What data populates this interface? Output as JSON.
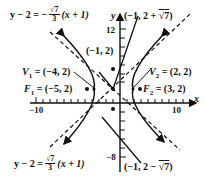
{
  "figure": {
    "type": "hyperbola-graph",
    "center": {
      "label": "(−1, 2)",
      "x": -1,
      "y": 2
    },
    "vertices": [
      {
        "name": "V",
        "sub": "1",
        "label": "= (−4, 2)",
        "x": -4,
        "y": 2
      },
      {
        "name": "V",
        "sub": "2",
        "label": "= (2, 2)",
        "x": 2,
        "y": 2
      }
    ],
    "foci": [
      {
        "name": "F",
        "sub": "1",
        "label": "= (−5, 2)",
        "x": -5,
        "y": 2
      },
      {
        "name": "F",
        "sub": "2",
        "label": "= (3, 2)",
        "x": 3,
        "y": 2
      }
    ],
    "conjugate_points": [
      {
        "label_prefix": "(−1, 2 + ",
        "radicand": "7",
        "label_suffix": ")"
      },
      {
        "label_prefix": "(−1, 2 − ",
        "radicand": "7",
        "label_suffix": ")"
      }
    ],
    "asymptotes": [
      {
        "lhs": "y − 2 = −",
        "num": "√7",
        "den": "3",
        "rhs": "(x + 1)"
      },
      {
        "lhs": "y − 2 =",
        "num": "√7",
        "den": "3",
        "rhs": "(x + 1)"
      }
    ],
    "axes": {
      "x_label": "x",
      "y_label": "y",
      "x_ticks": [
        "−10",
        "10"
      ],
      "y_ticks": [
        "12",
        "−8"
      ]
    }
  }
}
